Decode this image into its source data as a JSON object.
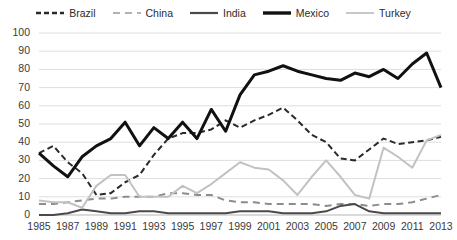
{
  "chart_data": {
    "type": "line",
    "title": "",
    "subtitle": "",
    "xlabel": "",
    "ylabel": "",
    "ylim": [
      0,
      100
    ],
    "ytick_step": 10,
    "yticks": [
      0,
      10,
      20,
      30,
      40,
      50,
      60,
      70,
      80,
      90,
      100
    ],
    "xticks": [
      1985,
      1987,
      1989,
      1991,
      1993,
      1995,
      1997,
      1999,
      2001,
      2003,
      2005,
      2007,
      2009,
      2011,
      2013
    ],
    "x": [
      1985,
      1986,
      1987,
      1988,
      1989,
      1990,
      1991,
      1992,
      1993,
      1994,
      1995,
      1996,
      1997,
      1998,
      1999,
      2000,
      2001,
      2002,
      2003,
      2004,
      2005,
      2006,
      2007,
      2008,
      2009,
      2010,
      2011,
      2012,
      2013
    ],
    "grid": true,
    "grid_axis": "y",
    "legend_position": "top",
    "series": [
      {
        "name": "Brazil",
        "color": "#2a2a2a",
        "style": "dashed",
        "width": 2,
        "values": [
          34,
          38,
          29,
          23,
          11,
          12,
          18,
          22,
          33,
          42,
          45,
          45,
          47,
          52,
          48,
          52,
          55,
          59,
          52,
          44,
          40,
          31,
          30,
          36,
          42,
          39,
          40,
          41,
          43
        ]
      },
      {
        "name": "China",
        "color": "#8c8c8c",
        "style": "dashed",
        "width": 2,
        "values": [
          6,
          6,
          7,
          8,
          9,
          9,
          10,
          10,
          10,
          12,
          12,
          11,
          11,
          8,
          7,
          7,
          6,
          6,
          6,
          6,
          5,
          6,
          6,
          5,
          6,
          6,
          7,
          9,
          11
        ]
      },
      {
        "name": "India",
        "color": "#4a4a4a",
        "style": "solid",
        "width": 2,
        "values": [
          0,
          0,
          1,
          3,
          2,
          1,
          1,
          2,
          2,
          1,
          1,
          1,
          1,
          1,
          2,
          2,
          2,
          1,
          1,
          1,
          2,
          5,
          6,
          2,
          1,
          1,
          1,
          1,
          1
        ]
      },
      {
        "name": "Mexico",
        "color": "#111111",
        "style": "solid",
        "width": 3,
        "values": [
          34,
          27,
          21,
          32,
          38,
          42,
          51,
          38,
          48,
          42,
          51,
          42,
          58,
          46,
          66,
          77,
          79,
          82,
          79,
          77,
          75,
          74,
          78,
          76,
          80,
          75,
          83,
          89,
          70
        ]
      },
      {
        "name": "Turkey",
        "color": "#c2c2c2",
        "style": "solid",
        "width": 2,
        "values": [
          8,
          7,
          7,
          4,
          16,
          22,
          22,
          10,
          10,
          10,
          16,
          12,
          17,
          23,
          29,
          26,
          25,
          19,
          11,
          21,
          30,
          21,
          11,
          9,
          37,
          32,
          26,
          41,
          44
        ]
      }
    ]
  }
}
